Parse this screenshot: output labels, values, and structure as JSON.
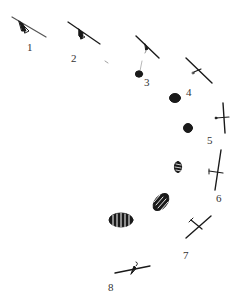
{
  "diagram": {
    "type": "sequence-illustration",
    "colors": {
      "ink": "#1a1a1a",
      "background": "#ffffff",
      "label": "#333333"
    },
    "steps": [
      {
        "label": "1",
        "label_pos": [
          27,
          42
        ],
        "glider": {
          "from": [
            10,
            20
          ],
          "to": [
            45,
            38
          ]
        }
      },
      {
        "label": "2",
        "label_pos": [
          71,
          53
        ],
        "glider": {
          "from": [
            68,
            22
          ],
          "to": [
            100,
            44
          ]
        }
      },
      {
        "label": "3",
        "label_pos": [
          144,
          77
        ],
        "glider": {
          "from": [
            136,
            36
          ],
          "to": [
            159,
            58
          ]
        }
      },
      {
        "label": "4",
        "label_pos": [
          186,
          87
        ],
        "glider": {
          "from": [
            186,
            58
          ],
          "to": [
            212,
            83
          ]
        }
      },
      {
        "label": "5",
        "label_pos": [
          207,
          135
        ],
        "glider": {
          "from": [
            223,
            103
          ],
          "to": [
            225,
            133
          ]
        }
      },
      {
        "label": "6",
        "label_pos": [
          216,
          193
        ],
        "glider": {
          "from": [
            221,
            150
          ],
          "to": [
            215,
            190
          ]
        }
      },
      {
        "label": "7",
        "label_pos": [
          183,
          250
        ],
        "glider": {
          "from": [
            186,
            238
          ],
          "to": [
            211,
            216
          ]
        }
      },
      {
        "label": "8",
        "label_pos": [
          108,
          282
        ],
        "glider": {
          "from": [
            115,
            273
          ],
          "to": [
            150,
            266
          ]
        }
      }
    ]
  }
}
